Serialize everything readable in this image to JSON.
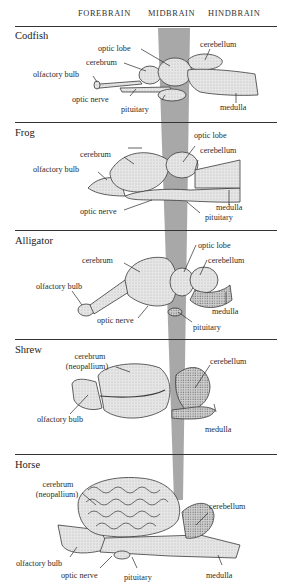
{
  "header": {
    "columns": [
      {
        "label": "FOREBRAIN"
      },
      {
        "label": "MIDBRAIN"
      },
      {
        "label": "HINDBRAIN"
      }
    ]
  },
  "colors": {
    "midbrain_band": "#a6a6a6",
    "rule": "#333333",
    "brain_fill": "#e4e4e4",
    "brain_stroke": "#3a3a3a"
  },
  "panels": [
    {
      "species": "Codfish",
      "labels": {
        "optic_lobe": "optic lobe",
        "cerebellum": "cerebellum",
        "cerebrum": "cerebrum",
        "olfactory_bulb": "olfactory bulb",
        "optic_nerve": "optic nerve",
        "pituitary": "pituitary",
        "medulla": "medulla"
      }
    },
    {
      "species": "Frog",
      "labels": {
        "optic_lobe": "optic lobe",
        "cerebellum": "cerebellum",
        "cerebrum": "cerebrum",
        "olfactory_bulb": "olfactory bulb",
        "medulla": "medulla",
        "optic_nerve": "optic nerve",
        "pituitary": "pituitary"
      }
    },
    {
      "species": "Alligator",
      "labels": {
        "optic_lobe": "optic lobe",
        "cerebrum": "cerebrum",
        "cerebellum": "cerebellum",
        "olfactory_bulb": "olfactory bulb",
        "medulla": "medulla",
        "optic_nerve": "optic nerve",
        "pituitary": "pituitary"
      }
    },
    {
      "species": "Shrew",
      "labels": {
        "cerebrum_line1": "cerebrum",
        "cerebrum_line2": "(neopallium)",
        "cerebellum": "cerebellum",
        "olfactory_bulb": "olfactory bulb",
        "medulla": "medulla"
      }
    },
    {
      "species": "Horse",
      "labels": {
        "cerebrum_line1": "cerebrum",
        "cerebrum_line2": "(neopallium)",
        "cerebellum": "cerebellum",
        "olfactory_bulb": "olfactory bulb",
        "optic_nerve": "optic nerve",
        "pituitary": "pituitary",
        "medulla": "medulla"
      }
    }
  ]
}
